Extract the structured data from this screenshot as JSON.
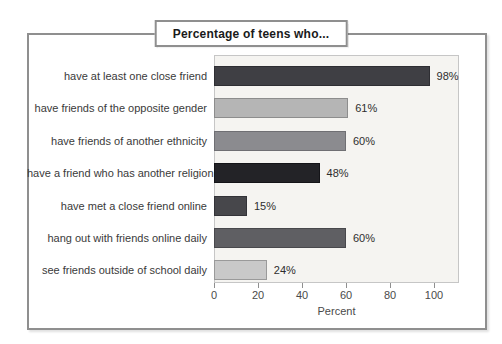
{
  "title": "Percentage of teens who...",
  "chart_data": {
    "type": "bar",
    "orientation": "horizontal",
    "title": "Percentage of teens who...",
    "categories": [
      "have at least one close friend",
      "have friends of the opposite gender",
      "have friends of another ethnicity",
      "have a friend who has another religion",
      "have met a close friend online",
      "hang out with friends online daily",
      "see friends outside of school daily"
    ],
    "values": [
      98,
      61,
      60,
      48,
      15,
      60,
      24
    ],
    "value_labels": [
      "98%",
      "61%",
      "60%",
      "48%",
      "15%",
      "60%",
      "24%"
    ],
    "bar_colors": [
      "#3f3f44",
      "#b5b5b5",
      "#8b8b8f",
      "#232327",
      "#47474b",
      "#5f5f63",
      "#c9c9c9"
    ],
    "bar_border_colors": [
      "#2e2e33",
      "#8d8d8d",
      "#6f6f73",
      "#141418",
      "#333338",
      "#48484c",
      "#9a9a9a"
    ],
    "xlabel": "Percent",
    "x_tick_labels": [
      "0",
      "20",
      "40",
      "60",
      "80",
      "100"
    ],
    "x_tick_values": [
      0,
      20,
      40,
      60,
      80,
      100
    ],
    "xlim": [
      0,
      110
    ],
    "grid": false,
    "legend": false
  },
  "colors": {
    "frame_border": "#8f8f8f",
    "plot_bg": "#f5f4f1",
    "plot_border": "#c6c6c6",
    "category_label": "#3a3a3a",
    "value_label": "#2e2e2e",
    "tick_label": "#4a4a4a",
    "background": "#ffffff"
  }
}
